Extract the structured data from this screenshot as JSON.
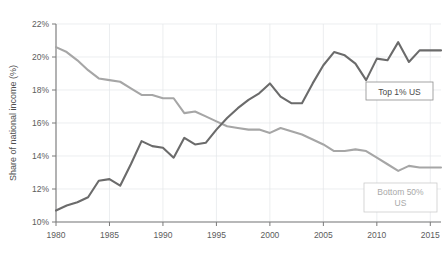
{
  "chart_data": {
    "type": "line",
    "title": "",
    "xlabel": "",
    "ylabel": "Share of national income (%)",
    "xlim": [
      1980,
      2016
    ],
    "ylim": [
      10,
      22
    ],
    "grid": true,
    "legend_position": "inside-right",
    "x_ticks": [
      "1980",
      "1985",
      "1990",
      "1995",
      "2000",
      "2005",
      "2010",
      "2015"
    ],
    "x_tick_values": [
      1980,
      1985,
      1990,
      1995,
      2000,
      2005,
      2010,
      2015
    ],
    "y_ticks": [
      "10%",
      "12%",
      "14%",
      "16%",
      "18%",
      "20%",
      "22%"
    ],
    "y_tick_values": [
      10,
      12,
      14,
      16,
      18,
      20,
      22
    ],
    "x": [
      1980,
      1981,
      1982,
      1983,
      1984,
      1985,
      1986,
      1987,
      1988,
      1989,
      1990,
      1991,
      1992,
      1993,
      1994,
      1995,
      1996,
      1997,
      1998,
      1999,
      2000,
      2001,
      2002,
      2003,
      2004,
      2005,
      2006,
      2007,
      2008,
      2009,
      2010,
      2011,
      2012,
      2013,
      2014,
      2015,
      2016
    ],
    "series": [
      {
        "name": "Top 1% US",
        "color": "#6b6b6b",
        "values": [
          10.7,
          11.0,
          11.2,
          11.5,
          12.5,
          12.6,
          12.2,
          13.5,
          14.9,
          14.6,
          14.5,
          13.9,
          15.1,
          14.7,
          14.8,
          15.6,
          16.3,
          16.9,
          17.4,
          17.8,
          18.4,
          17.6,
          17.2,
          17.2,
          18.4,
          19.5,
          20.3,
          20.1,
          19.6,
          18.6,
          19.9,
          19.8,
          20.9,
          19.7,
          20.4,
          20.4,
          20.4
        ]
      },
      {
        "name": "Bottom 50% US",
        "color": "#a6a6a6",
        "values": [
          20.6,
          20.3,
          19.8,
          19.2,
          18.7,
          18.6,
          18.5,
          18.1,
          17.7,
          17.7,
          17.5,
          17.5,
          16.6,
          16.7,
          16.4,
          16.1,
          15.8,
          15.7,
          15.6,
          15.6,
          15.4,
          15.7,
          15.5,
          15.3,
          15.0,
          14.7,
          14.3,
          14.3,
          14.4,
          14.3,
          13.9,
          13.5,
          13.1,
          13.4,
          13.3,
          13.3,
          13.3
        ]
      }
    ],
    "annotations": [
      {
        "id": "top1-label",
        "text": "Top 1% US",
        "color": "#4a4a4a"
      },
      {
        "id": "bottom50-label",
        "line1": "Bottom 50%",
        "line2": "US",
        "color": "#a9a9a9"
      }
    ]
  }
}
